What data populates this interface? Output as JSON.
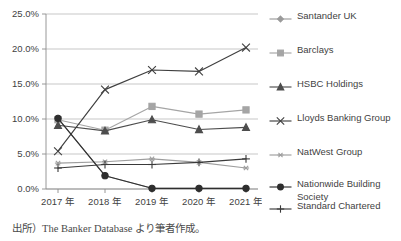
{
  "caption": "出所）The Banker Database より筆者作成。",
  "axis": {
    "ytick_labels": [
      "25.0%",
      "20.0%",
      "15.0%",
      "10.0%",
      "5.0%",
      "0.0%"
    ],
    "xtick_labels": [
      "2017 年",
      "2018 年",
      "2019 年",
      "2020 年",
      "2021 年"
    ]
  },
  "legend": {
    "items": [
      {
        "label": "Santander UK",
        "marker": "diamond",
        "color": "#9a9a9a"
      },
      {
        "label": "Barclays",
        "marker": "square",
        "color": "#a5a5a5"
      },
      {
        "label": "HSBC Holdings",
        "marker": "triangle",
        "color": "#4d4d4d"
      },
      {
        "label": "Lloyds Banking Group",
        "marker": "cross-x",
        "color": "#3f3f3f"
      },
      {
        "label": "NatWest Group",
        "marker": "asterisk",
        "color": "#9e9e9e"
      },
      {
        "label": "Nationwide Building\nSociety",
        "marker": "circle",
        "color": "#2e2e2e"
      },
      {
        "label": "Standard Chartered",
        "marker": "plus",
        "color": "#3a3a3a"
      }
    ]
  },
  "chart_data": {
    "type": "line",
    "title": "",
    "xlabel": "",
    "ylabel": "",
    "categories": [
      "2017 年",
      "2018 年",
      "2019 年",
      "2020 年",
      "2021 年"
    ],
    "ylim": [
      0,
      25
    ],
    "yticks": [
      0,
      5,
      10,
      15,
      20,
      25
    ],
    "y_unit": "%",
    "grid": "horizontal",
    "legend_position": "right",
    "series": [
      {
        "name": "Santander UK",
        "marker": "diamond",
        "color": "#9a9a9a",
        "values": [
          10.1,
          1.9,
          0.1,
          0.1,
          0.1
        ]
      },
      {
        "name": "Barclays",
        "marker": "square",
        "color": "#a5a5a5",
        "values": [
          9.9,
          8.4,
          11.8,
          10.7,
          11.3
        ]
      },
      {
        "name": "HSBC Holdings",
        "marker": "triangle",
        "color": "#4d4d4d",
        "values": [
          9.1,
          8.3,
          9.9,
          8.5,
          8.8
        ]
      },
      {
        "name": "Lloyds Banking Group",
        "marker": "cross-x",
        "color": "#3f3f3f",
        "values": [
          5.4,
          14.2,
          17.0,
          16.8,
          20.2
        ]
      },
      {
        "name": "NatWest Group",
        "marker": "asterisk",
        "color": "#9e9e9e",
        "values": [
          3.7,
          3.9,
          4.3,
          3.8,
          3.0
        ]
      },
      {
        "name": "Nationwide Building Society",
        "marker": "circle",
        "color": "#2e2e2e",
        "values": [
          10.1,
          1.9,
          0.1,
          0.1,
          0.1
        ]
      },
      {
        "name": "Standard Chartered",
        "marker": "plus",
        "color": "#3a3a3a",
        "values": [
          3.0,
          3.5,
          3.5,
          3.8,
          4.3
        ]
      }
    ]
  }
}
